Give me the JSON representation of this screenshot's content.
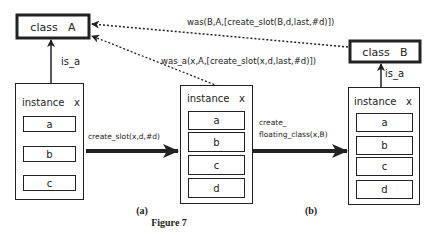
{
  "figure": {
    "caption": "Figure 7",
    "panel_a": "(a)",
    "panel_b": "(b)"
  },
  "classes": {
    "A": {
      "label": "class   A"
    },
    "B": {
      "label": "class   B"
    }
  },
  "relations": {
    "is_a_left": "is_a",
    "is_a_right": "is_a",
    "was_label": "was(B,A,[create_slot(B,d,last,#d)])",
    "was_a_label": "was_a(x,A,[create_slot(x,d,last,#d)])"
  },
  "transitions": {
    "create_slot": "create_slot(x,d,#d)",
    "create_floating_line1": "create_",
    "create_floating_line2": "floating_class(x,B)"
  },
  "instances": [
    {
      "title": "instance   x",
      "slots": [
        "a",
        "b",
        "c"
      ]
    },
    {
      "title": "instance   x",
      "slots": [
        "a",
        "b",
        "c",
        "d"
      ]
    },
    {
      "title": "instance   x",
      "slots": [
        "a",
        "b",
        "c",
        "d"
      ]
    }
  ],
  "colors": {
    "stroke": "#222222",
    "background": "#ffffff"
  }
}
